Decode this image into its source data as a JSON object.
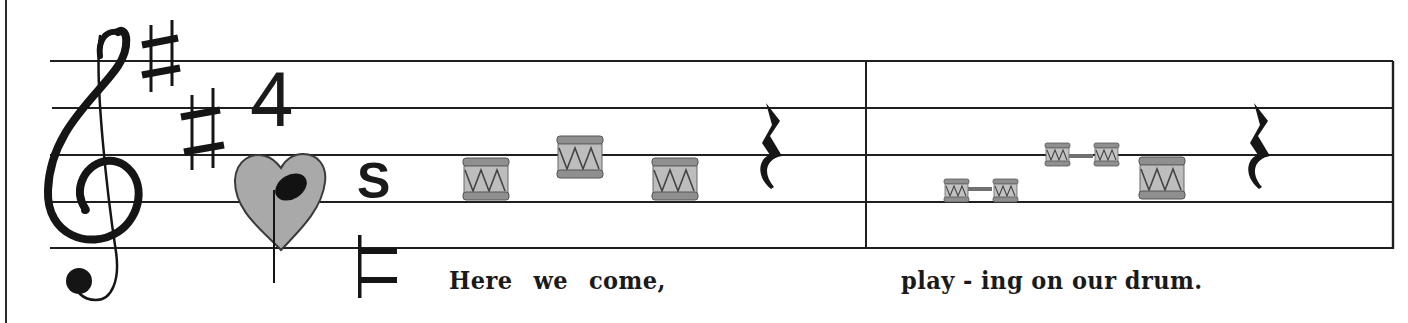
{
  "score": {
    "clef": "treble",
    "key_signature": {
      "sharps": 2,
      "label": "♯♯"
    },
    "time_signature": {
      "top": "4",
      "bottom_symbol": "heart-quarter-note",
      "extra_mark": "S"
    },
    "staff": {
      "line_ys": [
        61,
        108,
        155,
        202,
        248
      ],
      "x_start": 50,
      "x_end": 1393,
      "barline_x": 866,
      "color": "#1f1f1f"
    },
    "measures": [
      {
        "notes": [
          {
            "type": "drum-quarter",
            "pitch": "G4",
            "x": 463,
            "y": 160
          },
          {
            "type": "drum-quarter",
            "pitch": "B4",
            "x": 557,
            "y": 136
          },
          {
            "type": "drum-quarter",
            "pitch": "G4",
            "x": 652,
            "y": 160
          },
          {
            "type": "quarter-rest",
            "x": 760
          }
        ],
        "lyrics": "Here   we   come,"
      },
      {
        "notes": [
          {
            "type": "drum-eighth-pair",
            "pitch": "F#4",
            "x": 946,
            "y": 178
          },
          {
            "type": "drum-eighth-pair",
            "pitch": "A4",
            "x": 1044,
            "y": 142
          },
          {
            "type": "drum-quarter",
            "pitch": "G4",
            "x": 1139,
            "y": 156
          },
          {
            "type": "quarter-rest",
            "x": 1240
          }
        ],
        "lyrics": "play - ing on our drum."
      }
    ],
    "colors": {
      "ink": "#1a1a1a",
      "heart_fill": "#a9a9a9",
      "drum_body": "#b4b4b4",
      "drum_rim": "#8a8a8a",
      "drum_light": "#d4d4d4"
    }
  }
}
